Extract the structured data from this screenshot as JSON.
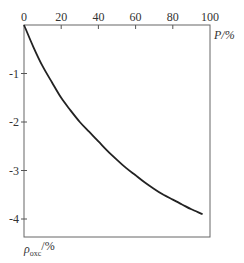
{
  "chart_data": {
    "type": "line",
    "title": "",
    "xlabel": "P/%",
    "ylabel": "ρ_oxc/%",
    "ylabel_main": "ρ",
    "ylabel_sub": "oxc",
    "ylabel_unit": "/%",
    "xlim": [
      0,
      100
    ],
    "ylim": [
      -4.4,
      0
    ],
    "x_ticks": [
      0,
      20,
      40,
      60,
      80,
      100
    ],
    "x_tick_labels": [
      "0",
      "20",
      "40",
      "60",
      "80",
      "100"
    ],
    "y_ticks": [
      -1,
      -2,
      -3,
      -4
    ],
    "y_tick_labels": [
      "-1",
      "-2",
      "-3",
      "-4"
    ],
    "x_axis_position": "top",
    "grid": false,
    "legend": null,
    "series": [
      {
        "name": "curve",
        "x": [
          0,
          5,
          10,
          15,
          20,
          25,
          30,
          35,
          40,
          45,
          50,
          55,
          60,
          65,
          70,
          75,
          80,
          85,
          90,
          96
        ],
        "values": [
          0,
          -0.45,
          -0.85,
          -1.18,
          -1.5,
          -1.76,
          -2.0,
          -2.2,
          -2.4,
          -2.6,
          -2.78,
          -2.95,
          -3.1,
          -3.25,
          -3.38,
          -3.5,
          -3.6,
          -3.7,
          -3.8,
          -3.9
        ]
      }
    ]
  },
  "colors": {
    "line": "#222222",
    "axis": "#555555",
    "text": "#333333"
  }
}
